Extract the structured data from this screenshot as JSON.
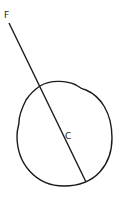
{
  "diagram": {
    "labels": {
      "point_f": "F",
      "point_c": "C"
    },
    "colors": {
      "stroke": "#1a1a1a",
      "background": "#ffffff"
    }
  }
}
